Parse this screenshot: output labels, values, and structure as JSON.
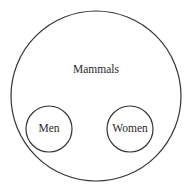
{
  "diagram": {
    "type": "euler",
    "stroke_color": "#333333",
    "text_color": "#2a2a2a",
    "background": "#ffffff",
    "outer": {
      "label": "Mammals",
      "cx": 96,
      "cy": 96,
      "r": 85
    },
    "inner": [
      {
        "label": "Men",
        "cx": 49,
        "cy": 129,
        "r": 23
      },
      {
        "label": "Women",
        "cx": 130,
        "cy": 129,
        "r": 23
      }
    ]
  }
}
